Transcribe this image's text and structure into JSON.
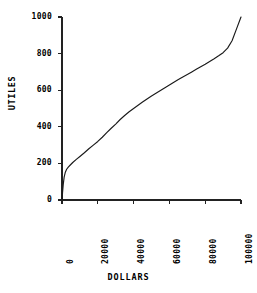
{
  "chart_data": {
    "type": "line",
    "title": "",
    "xlabel": "DOLLARS",
    "ylabel": "UTILES",
    "xlim": [
      0,
      100000
    ],
    "ylim": [
      0,
      1000
    ],
    "grid": false,
    "legend": null,
    "xticks": [
      0,
      20000,
      40000,
      60000,
      80000,
      100000
    ],
    "xtick_labels": [
      "0",
      "20000",
      "40000",
      "60000",
      "80000",
      "100000"
    ],
    "xtick_rotation": 90,
    "yticks": [
      0,
      200,
      400,
      600,
      800,
      1000
    ],
    "ytick_labels": [
      "0",
      "200",
      "400",
      "600",
      "800",
      "1000"
    ],
    "series": [
      {
        "name": "utility",
        "color": "#1a1a1a",
        "x": [
          0,
          300,
          700,
          1200,
          1800,
          2600,
          3500,
          4500,
          6000,
          8000,
          10000,
          12500,
          15000,
          17500,
          20000,
          22500,
          25000,
          27500,
          30000,
          32500,
          35000,
          37500,
          40000,
          42500,
          45000,
          47500,
          50000,
          52500,
          55000,
          57500,
          60000,
          62500,
          65000,
          67500,
          70000,
          72500,
          75000,
          77500,
          80000,
          82500,
          85000,
          87500,
          90000,
          92500,
          95000,
          97500,
          100000
        ],
        "y": [
          0,
          40,
          85,
          125,
          150,
          168,
          180,
          190,
          205,
          222,
          238,
          258,
          280,
          300,
          320,
          343,
          368,
          392,
          415,
          440,
          462,
          482,
          500,
          518,
          535,
          552,
          568,
          583,
          598,
          613,
          628,
          643,
          658,
          672,
          686,
          700,
          714,
          728,
          742,
          757,
          772,
          788,
          805,
          830,
          870,
          935,
          1000
        ]
      }
    ]
  },
  "axis": {
    "ylabel_text": "UTILES",
    "xlabel_text": "DOLLARS"
  }
}
